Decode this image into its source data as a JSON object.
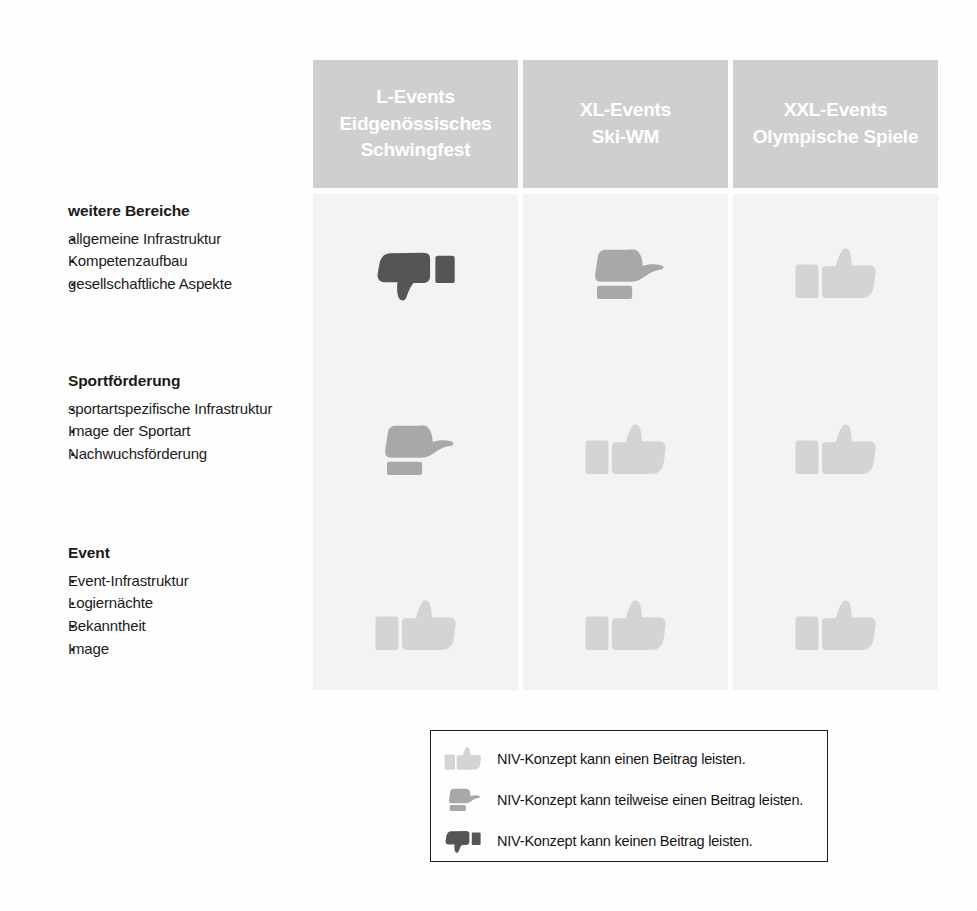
{
  "columns": [
    {
      "id": "l-events",
      "line1": "L-Events",
      "line2": "Eidgenössisches",
      "line3": "Schwingfest"
    },
    {
      "id": "xl-events",
      "line1": "XL-Events",
      "line2": "Ski-WM",
      "line3": ""
    },
    {
      "id": "xxl-events",
      "line1": "XXL-Events",
      "line2": "Olympische Spiele",
      "line3": ""
    }
  ],
  "rows": [
    {
      "id": "weitere-bereiche",
      "title": "weitere Bereiche",
      "items": [
        "allgemeine Infrastruktur",
        "Kompetenzaufbau",
        "gesellschaftliche Aspekte"
      ],
      "ratings": [
        "negative",
        "partial",
        "positive"
      ]
    },
    {
      "id": "sportfoerderung",
      "title": "Sportförderung",
      "items": [
        "sportartspezifische Infrastruktur",
        "Image der Sportart",
        "Nachwuchsförderung"
      ],
      "ratings": [
        "partial",
        "positive",
        "positive"
      ]
    },
    {
      "id": "event",
      "title": "Event",
      "items": [
        "Event-Infrastruktur",
        "Logiernächte",
        "Bekanntheit",
        "Image"
      ],
      "ratings": [
        "positive",
        "positive",
        "positive"
      ]
    }
  ],
  "legend": {
    "entries": [
      {
        "rating": "positive",
        "icon_name": "thumbs-up-icon",
        "text": "NIV-Konzept kann einen Beitrag leisten."
      },
      {
        "rating": "partial",
        "icon_name": "thumbs-side-icon",
        "text": "NIV-Konzept kann teilweise einen Beitrag leisten."
      },
      {
        "rating": "negative",
        "icon_name": "thumbs-down-icon",
        "text": "NIV-Konzept kann keinen Beitrag leisten."
      }
    ]
  },
  "colors": {
    "header_band": "#cfcfcf",
    "column_band": "#f3f3f3",
    "rating_positive": "#d4d4d4",
    "rating_partial": "#a8a8a8",
    "rating_negative": "#555555",
    "text": "#1a1a1a",
    "header_text": "#ffffff",
    "legend_border": "#1f1f1f",
    "page_background": "#fefefe"
  }
}
